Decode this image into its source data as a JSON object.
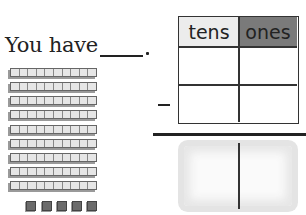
{
  "prompt": {
    "text": "You have",
    "answer_blank": ""
  },
  "manipulatives": {
    "tens_rods": 9,
    "ones_cubes": 5,
    "rod_colors": {
      "fill": "#e6e6e6",
      "shade": "#9a9a9a"
    },
    "cube_color": "#6b6b6b"
  },
  "place_value_table": {
    "headers": [
      {
        "label": "tens",
        "bg": "#ececec"
      },
      {
        "label": "ones",
        "bg": "#7a7a7a"
      }
    ],
    "rows": [
      {
        "operator": "",
        "tens": "",
        "ones": ""
      },
      {
        "operator": "−",
        "tens": "",
        "ones": ""
      }
    ],
    "answer_row": {
      "tens": "",
      "ones": ""
    }
  }
}
